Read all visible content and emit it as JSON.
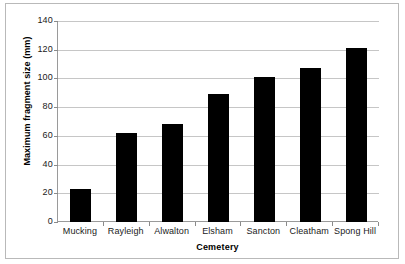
{
  "chart_data": {
    "type": "bar",
    "title": "",
    "xlabel": "Cemetery",
    "ylabel": "Maximum fragment size (mm)",
    "categories": [
      "Mucking",
      "Rayleigh",
      "Alwalton",
      "Elsham",
      "Sancton",
      "Cleatham",
      "Spong Hill"
    ],
    "values": [
      23,
      62,
      68,
      89,
      101,
      107,
      121
    ],
    "ylim": [
      0,
      140
    ],
    "ytick_labels": [
      "0",
      "20",
      "40",
      "60",
      "80",
      "100",
      "120",
      "140"
    ],
    "ytick_values": [
      0,
      20,
      40,
      60,
      80,
      100,
      120,
      140
    ],
    "grid": "horizontal",
    "legend": "none",
    "bar_color": "#000000",
    "gridline_color": "#c6c6c6",
    "axis_color": "#9a9a9a",
    "background_color": "#ffffff"
  }
}
